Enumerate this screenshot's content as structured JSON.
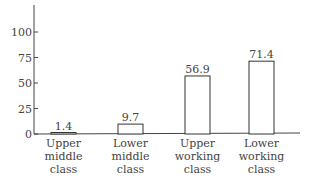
{
  "chart_data": {
    "type": "bar",
    "title": "",
    "xlabel": "",
    "ylabel": "",
    "categories": [
      "Upper middle class",
      "Lower middle class",
      "Upper working class",
      "Lower working class"
    ],
    "category_lines": [
      [
        "Upper",
        "middle",
        "class"
      ],
      [
        "Lower",
        "middle",
        "class"
      ],
      [
        "Upper",
        "working",
        "class"
      ],
      [
        "Lower",
        "working",
        "class"
      ]
    ],
    "values": [
      1.4,
      9.7,
      56.9,
      71.4
    ],
    "value_labels": [
      "1.4",
      "9.7",
      "56.9",
      "71.4"
    ],
    "yticks": [
      0,
      25,
      50,
      75,
      100
    ],
    "ylim": [
      0,
      125
    ],
    "grid": false,
    "legend": null,
    "colors": {
      "bar_fill": "#ffffff",
      "bar_stroke": "#333333",
      "axis": "#444444"
    }
  }
}
